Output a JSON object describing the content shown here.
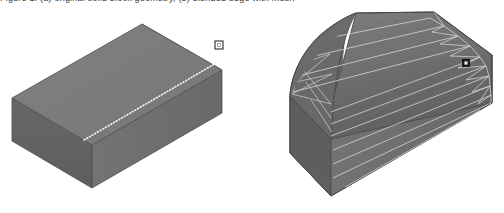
{
  "viewport": {
    "width": 504,
    "height": 213,
    "background": "#ffffff"
  },
  "caption_strip": {
    "text": "Figure 1. (a) original solid block geometry, (b) blended edge with mesh"
  },
  "palette": {
    "top_face": "#7b7b7b",
    "left_face": "#636363",
    "right_face": "#6e6e6e",
    "fillet_face": "#6a6a6a",
    "fillet_shadow": "#5d5d5d",
    "outline": "#4a4a4a",
    "mesh_line": "#d8d8d8",
    "mesh_line_soft": "#c4c4c4",
    "dotted_edge": "#f2f2f2",
    "handle_fill": "#ffffff",
    "handle_stroke": "#2b2b2b",
    "marker_fill": "#1e1e1e",
    "background": "#ffffff"
  },
  "figures": [
    {
      "id": "figure-a",
      "label": "original-block",
      "description": "Isometric rectangular solid with highlighted top-back edge",
      "selected_edge": "top-back-long-edge",
      "edge_style": "dotted",
      "handle": {
        "x": 219,
        "y": 45,
        "size": 8,
        "kind": "selection-handle"
      }
    },
    {
      "id": "figure-b",
      "label": "blended-block",
      "description": "Same solid with a fillet blend applied to the top-back edge, showing surface mesh isolines",
      "blend": "fillet",
      "mesh_isolines": 11,
      "mesh_cross_rows": 9,
      "marker": {
        "x": 466,
        "y": 63,
        "size": 7,
        "kind": "edge-marker"
      }
    }
  ]
}
